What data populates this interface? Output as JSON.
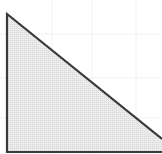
{
  "diagram": {
    "type": "geometry",
    "shape": "right-triangle",
    "colors": {
      "background": "#ffffff",
      "fill": "#e6e6e6",
      "stroke": "#3a3a3a",
      "grid": "#f0f0f0"
    },
    "vertices": [
      {
        "x": 7,
        "y": 14
      },
      {
        "x": 7,
        "y": 152
      },
      {
        "x": 162,
        "y": 152
      },
      {
        "x": 162,
        "y": 139
      }
    ],
    "grid": {
      "vertical": [
        52,
        92,
        136
      ],
      "horizontal": [
        34,
        78,
        118
      ]
    }
  }
}
